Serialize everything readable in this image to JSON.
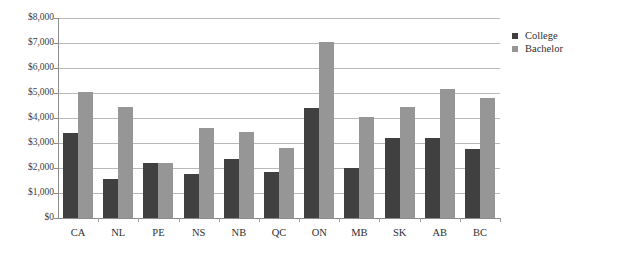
{
  "chart_data": {
    "type": "bar",
    "title": "",
    "xlabel": "",
    "ylabel": "",
    "ylim": [
      0,
      8000
    ],
    "grid": true,
    "legend_position": "right",
    "categories": [
      "CA",
      "NL",
      "PE",
      "NS",
      "NB",
      "QC",
      "ON",
      "MB",
      "SK",
      "AB",
      "BC"
    ],
    "y_ticks": [
      0,
      1000,
      2000,
      3000,
      4000,
      5000,
      6000,
      7000,
      8000
    ],
    "y_tick_labels": [
      "$0",
      "$1,000",
      "$2,000",
      "$3,000",
      "$4,000",
      "$5,000",
      "$6,000",
      "$7,000",
      "$8,000"
    ],
    "series": [
      {
        "name": "College",
        "color": "#404040",
        "values": [
          3400,
          1550,
          2200,
          1750,
          2350,
          1850,
          4400,
          2000,
          3200,
          3200,
          2750
        ]
      },
      {
        "name": "Bachelor",
        "color": "#969696",
        "values": [
          5050,
          4450,
          2200,
          3600,
          3450,
          2800,
          7050,
          4050,
          4450,
          5150,
          4800
        ]
      }
    ]
  },
  "legend": {
    "items": [
      {
        "label": "College",
        "swatch": "college-swatch-icon"
      },
      {
        "label": "Bachelor",
        "swatch": "bachelor-swatch-icon"
      }
    ]
  }
}
